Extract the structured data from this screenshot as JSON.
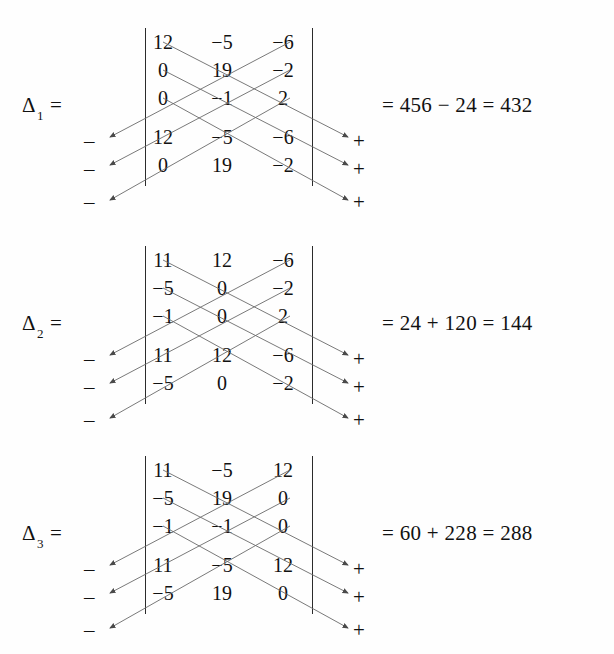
{
  "document": {
    "title": "Sarrus rule determinant computations",
    "background_color": "#ffffff",
    "ink_color": "#111111",
    "rule_color": "#2b2b2b",
    "arrow_color": "#555555"
  },
  "symbols": {
    "minus_sign": "–",
    "plus_sign": "+",
    "equals": "=",
    "delta": "Δ"
  },
  "blocks": [
    {
      "id": "delta-1",
      "label": {
        "delta": "Δ",
        "subscript": "1",
        "equals": "="
      },
      "matrix": {
        "rows": [
          [
            "12",
            "−5",
            "−6"
          ],
          [
            "0",
            "19",
            "−2"
          ],
          [
            "0",
            "−1",
            "2"
          ],
          [
            "12",
            "−5",
            "−6"
          ],
          [
            "0",
            "19",
            "−2"
          ]
        ]
      },
      "left_signs": [
        "–",
        "–",
        "–"
      ],
      "right_signs": [
        "+",
        "+",
        "+"
      ],
      "result": "= 456 − 24 = 432",
      "result_parts": {
        "positive_sum": "456",
        "operator": "−",
        "negative_sum": "24",
        "value": "432"
      }
    },
    {
      "id": "delta-2",
      "label": {
        "delta": "Δ",
        "subscript": "2",
        "equals": "="
      },
      "matrix": {
        "rows": [
          [
            "11",
            "12",
            "−6"
          ],
          [
            "−5",
            "0",
            "−2"
          ],
          [
            "−1",
            "0",
            "2"
          ],
          [
            "11",
            "12",
            "−6"
          ],
          [
            "−5",
            "0",
            "−2"
          ]
        ]
      },
      "left_signs": [
        "–",
        "–",
        "–"
      ],
      "right_signs": [
        "+",
        "+",
        "+"
      ],
      "result": "= 24 + 120 = 144",
      "result_parts": {
        "positive_sum": "24",
        "operator": "+",
        "negative_sum": "120",
        "value": "144"
      }
    },
    {
      "id": "delta-3",
      "label": {
        "delta": "Δ",
        "subscript": "3",
        "equals": "="
      },
      "matrix": {
        "rows": [
          [
            "11",
            "−5",
            "12"
          ],
          [
            "−5",
            "19",
            "0"
          ],
          [
            "−1",
            "−1",
            "0"
          ],
          [
            "11",
            "−5",
            "12"
          ],
          [
            "−5",
            "19",
            "0"
          ]
        ]
      },
      "left_signs": [
        "–",
        "–",
        "–"
      ],
      "right_signs": [
        "+",
        "+",
        "+"
      ],
      "result": "= 60 + 228 = 288",
      "result_parts": {
        "positive_sum": "60",
        "operator": "+",
        "negative_sum": "228",
        "value": "288"
      }
    }
  ]
}
